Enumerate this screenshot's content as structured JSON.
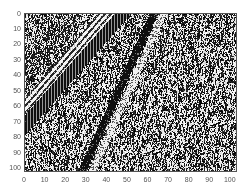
{
  "chart_data": {
    "type": "heatmap",
    "title": "",
    "xlabel": "",
    "ylabel": "",
    "xlim": [
      0,
      103
    ],
    "ylim": [
      102,
      0
    ],
    "x_ticks": [
      0,
      10,
      20,
      30,
      40,
      50,
      60,
      70,
      80,
      90,
      100
    ],
    "y_ticks": [
      0,
      10,
      20,
      30,
      40,
      50,
      60,
      70,
      80,
      90,
      100
    ],
    "grid": false,
    "colormap": "gray (binary wiggle/variable-density seismic-style)",
    "events": [
      {
        "name": "wide dark band",
        "style": "black with vertical stripes",
        "top_x_range": [
          44,
          52
        ],
        "left_y_range": [
          66,
          79
        ]
      },
      {
        "name": "white fringe above wide band",
        "style": "white diagonal stripes",
        "top_x_range": [
          36,
          44
        ],
        "left_y_range": [
          55,
          66
        ]
      },
      {
        "name": "thin dark band",
        "style": "black",
        "top_x_range": [
          61,
          65
        ],
        "bottom_x_range": [
          26,
          30
        ]
      },
      {
        "name": "light band beside thin band",
        "style": "white streaks",
        "top_x_range": [
          66,
          69
        ],
        "bottom_x_range": [
          31,
          35
        ]
      }
    ]
  },
  "axes": {
    "x_tick_labels": [
      "0",
      "10",
      "20",
      "30",
      "40",
      "50",
      "60",
      "70",
      "80",
      "90",
      "100"
    ],
    "y_tick_labels": [
      "0",
      "10",
      "20",
      "30",
      "40",
      "50",
      "60",
      "70",
      "80",
      "90",
      "100"
    ]
  },
  "colors": {
    "dark": "#111111",
    "light": "#f4f4f4",
    "axis": "#555555"
  }
}
